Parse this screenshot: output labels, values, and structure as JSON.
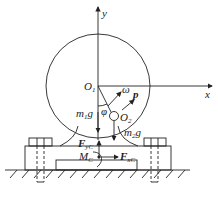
{
  "diagram": {
    "axes": {
      "x_label": "x",
      "y_label": "y"
    },
    "points": {
      "O1": "O",
      "O1_sub": "1",
      "O2": "O",
      "O2_sub": "2"
    },
    "symbols": {
      "omega": "ω",
      "p": "p",
      "phi": "φ"
    },
    "forces": {
      "m1g": {
        "main": "m",
        "sub": "1",
        "tail": "g"
      },
      "m2g": {
        "main": "m",
        "sub": "2",
        "tail": "g"
      },
      "Fyc": {
        "main": "F",
        "sub": "yC"
      },
      "Fxc": {
        "main": "F",
        "sub": "xC"
      },
      "Mc": {
        "main": "M",
        "sub": "C"
      }
    },
    "colors": {
      "line": "#222222",
      "background": "#ffffff"
    }
  }
}
